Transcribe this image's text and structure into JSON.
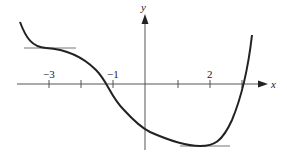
{
  "figure": {
    "x_axis_label": "x",
    "y_axis_label": "y",
    "tick_labels": [
      {
        "value": -3,
        "text": "−3"
      },
      {
        "value": -1,
        "text": "−1"
      },
      {
        "value": 2,
        "text": "2"
      }
    ],
    "tick_values": [
      -3,
      -2,
      -1,
      1,
      2,
      3
    ],
    "curve_color": "#222222",
    "axis_color": "#555555",
    "tangent_color": "#777777",
    "horizontal_tangents": [
      {
        "x": -3,
        "description": "horizontal tangent at x = -3 (inflection, flat)"
      },
      {
        "x": 2,
        "description": "horizontal tangent at x = 2 (local minimum)"
      }
    ],
    "x_intercepts_approx": [
      -1.25,
      3
    ]
  }
}
